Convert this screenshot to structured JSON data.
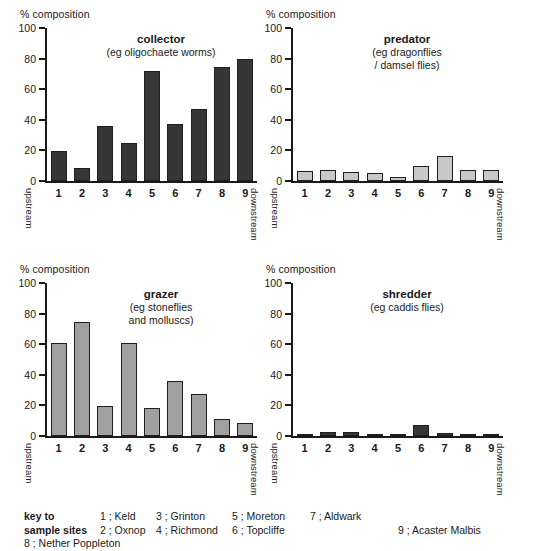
{
  "axis_caption": "% composition",
  "y_ticks": [
    0,
    20,
    40,
    60,
    80,
    100
  ],
  "y_axis_max": 100,
  "flow": {
    "upstream": "upstream",
    "downstream": "downstream"
  },
  "colors": {
    "dark_bar": "#363636",
    "mid_bar": "#a0a0a0",
    "light_bar": "#c8c8c8",
    "axis": "#1a1a1a",
    "background": "#ffffff"
  },
  "chart_data": [
    {
      "type": "bar",
      "title": "collector",
      "subtitle": [
        "(eg oligochaete worms)"
      ],
      "xlabel": "",
      "ylabel": "% composition",
      "ylim": [
        0,
        100
      ],
      "grid": false,
      "bar_color": "#363636",
      "categories": [
        "1",
        "2",
        "3",
        "4",
        "5",
        "6",
        "7",
        "8",
        "9"
      ],
      "values": [
        19.5,
        8.5,
        36,
        25,
        72,
        37.5,
        47,
        74.5,
        80
      ]
    },
    {
      "type": "bar",
      "title": "predator",
      "subtitle": [
        "(eg dragonflies",
        "/ damsel flies)"
      ],
      "xlabel": "",
      "ylabel": "% composition",
      "ylim": [
        0,
        100
      ],
      "grid": false,
      "bar_color": "#c8c8c8",
      "categories": [
        "1",
        "2",
        "3",
        "4",
        "5",
        "6",
        "7",
        "8",
        "9"
      ],
      "values": [
        6.5,
        7,
        6,
        5.5,
        2.5,
        10,
        16.5,
        7,
        7
      ]
    },
    {
      "type": "bar",
      "title": "grazer",
      "subtitle": [
        "(eg stoneflies",
        "and molluscs)"
      ],
      "xlabel": "",
      "ylabel": "% composition",
      "ylim": [
        0,
        100
      ],
      "grid": false,
      "bar_color": "#a0a0a0",
      "categories": [
        "1",
        "2",
        "3",
        "4",
        "5",
        "6",
        "7",
        "8",
        "9"
      ],
      "values": [
        61,
        74.5,
        19.5,
        61,
        18.5,
        36,
        27.5,
        11,
        8.5
      ]
    },
    {
      "type": "bar",
      "title": "shredder",
      "subtitle": [
        "(eg caddis flies)"
      ],
      "xlabel": "",
      "ylabel": "% composition",
      "ylim": [
        0,
        100
      ],
      "grid": false,
      "bar_color": "#363636",
      "categories": [
        "1",
        "2",
        "3",
        "4",
        "5",
        "6",
        "7",
        "8",
        "9"
      ],
      "values": [
        1,
        2.5,
        2.5,
        1,
        1.2,
        7,
        2,
        0.8,
        1.2
      ]
    }
  ],
  "key": {
    "head_line1": "key to",
    "head_line2": "sample sites",
    "entries": [
      {
        "num": "1",
        "name": "Keld"
      },
      {
        "num": "2",
        "name": "Oxnop"
      },
      {
        "num": "3",
        "name": "Grinton"
      },
      {
        "num": "4",
        "name": "Richmond"
      },
      {
        "num": "5",
        "name": "Moreton"
      },
      {
        "num": "6",
        "name": "Topcliffe"
      },
      {
        "num": "7",
        "name": "Aldwark"
      },
      {
        "num": "8",
        "name": "Nether Poppleton"
      },
      {
        "num": "9",
        "name": "Acaster Malbis"
      }
    ],
    "separator": " ; "
  }
}
